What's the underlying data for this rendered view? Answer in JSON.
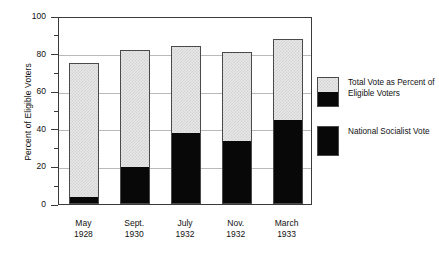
{
  "chart_data": {
    "type": "bar",
    "subtype": "stacked-bar",
    "title": "",
    "xlabel": "",
    "ylabel": "Percent of Eligible Voters",
    "ylim": [
      0,
      100
    ],
    "ytick_major_step": 20,
    "ytick_minor_step": 10,
    "ytick_labels": [
      "0",
      "20",
      "40",
      "60",
      "80",
      "100"
    ],
    "grid": "horizontal",
    "legend_position": "right",
    "categories": [
      "May\n1928",
      "Sept.\n1930",
      "July\n1932",
      "Nov.\n1932",
      "March\n1933"
    ],
    "category_lines": [
      [
        "May",
        "1928"
      ],
      [
        "Sept.",
        "1930"
      ],
      [
        "July",
        "1932"
      ],
      [
        "Nov.",
        "1932"
      ],
      [
        "March",
        "1933"
      ]
    ],
    "series": [
      {
        "name": "Total Vote as Percent of Eligible Voters",
        "swatch": "split-gray-black",
        "values": [
          75,
          82,
          84,
          81,
          88
        ]
      },
      {
        "name": "National Socialist Vote",
        "swatch": "solid-black",
        "values": [
          3,
          19,
          37,
          33,
          44
        ]
      }
    ],
    "colors": {
      "total_vote_fill": "#e7e7e7",
      "nazi_vote_fill": "#080808",
      "bar_border": "#4a4a4a",
      "gridline": "#b9b9b9",
      "axis": "#3a3a3a"
    }
  },
  "legend": {
    "entries": [
      {
        "label": "Total Vote as Percent of Eligible Voters",
        "swatch": "split"
      },
      {
        "label": "National Socialist Vote",
        "swatch": "solid"
      }
    ]
  }
}
